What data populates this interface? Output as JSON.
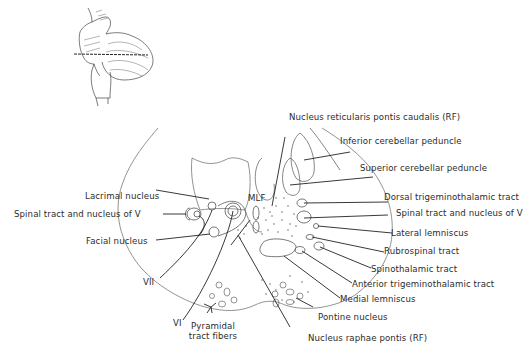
{
  "figure": {
    "inset_description": "Brainstem with cerebellum, horizontal line indicating section level",
    "labels": {
      "nucleus_reticularis_pontis_caudalis": "Nucleus reticularis pontis caudalis (RF)",
      "inferior_cerebellar_peduncle": "Inferior cerebellar peduncle",
      "superior_cerebellar_peduncle": "Superior cerebellar peduncle",
      "dorsal_trigeminothalamic_tract": "Dorsal trigeminothalamic tract",
      "spinal_tract_v_right": "Spinal tract and nucleus of V",
      "lateral_lemniscus": "Lateral lemniscus",
      "rubrospinal_tract": "Rubrospinal tract",
      "spinothalamic_tract": "Spinothalamic tract",
      "anterior_trigeminothalamic_tract": "Anterior trigeminothalamic tract",
      "medial_lemniscus": "Medial lemniscus",
      "pontine_nucleus": "Pontine nucleus",
      "nucleus_raphae_pontis": "Nucleus raphae pontis (RF)",
      "pyramidal_tract_fibers_line1": "Pyramidal",
      "pyramidal_tract_fibers_line2": "tract fibers",
      "nerve_vi": "VI",
      "nerve_vii": "VII",
      "facial_nucleus": "Facial nucleus",
      "spinal_tract_v_left": "Spinal tract and nucleus of V",
      "lacrimal_nucleus": "Lacrimal nucleus",
      "mlf": "MLF"
    }
  }
}
